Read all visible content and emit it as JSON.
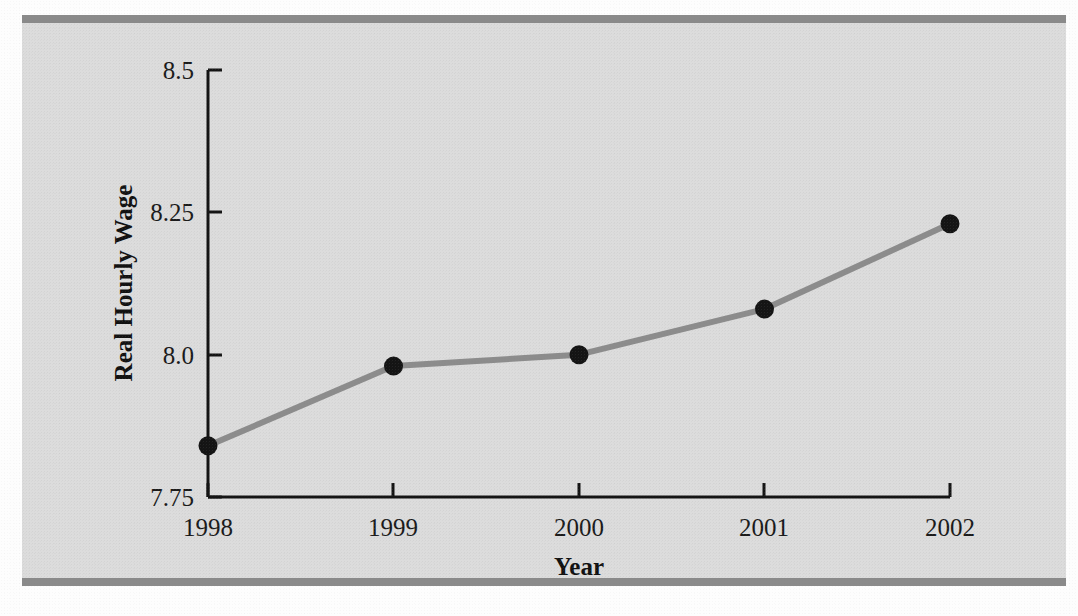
{
  "figure": {
    "background_color": "#dcdcdc",
    "page_color": "#fdfdfd",
    "rule_color": "#8a8a8a",
    "line_color": "#8c8c8c",
    "marker_color": "#141414",
    "axis_color": "#131313"
  },
  "chart_data": {
    "type": "line",
    "title": "",
    "xlabel": "Year",
    "ylabel": "Real Hourly Wage",
    "categories": [
      "1998",
      "1999",
      "2000",
      "2001",
      "2002"
    ],
    "x": [
      1998,
      1999,
      2000,
      2001,
      2002
    ],
    "values": [
      7.84,
      7.98,
      8.0,
      8.08,
      8.23
    ],
    "series": [
      {
        "name": "Real Hourly Wage",
        "values": [
          7.84,
          7.98,
          8.0,
          8.08,
          8.23
        ]
      }
    ],
    "xlim": [
      1998,
      2002
    ],
    "ylim": [
      7.75,
      8.5
    ],
    "ytick_labels": [
      "7.75",
      "8.0",
      "8.25",
      "8.5"
    ],
    "ytick_values": [
      7.75,
      8.0,
      8.25,
      8.5
    ],
    "xtick_labels": [
      "1998",
      "1999",
      "2000",
      "2001",
      "2002"
    ],
    "grid": false,
    "legend": false,
    "marker": "circle"
  }
}
